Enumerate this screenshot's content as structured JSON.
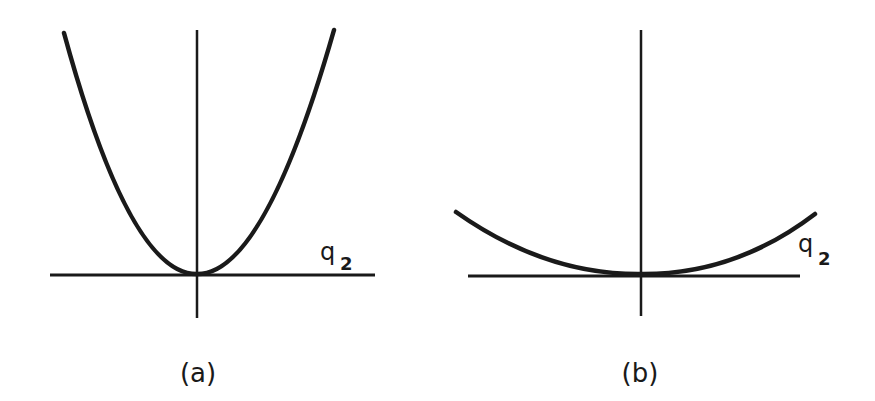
{
  "panels": [
    {
      "id": "a",
      "caption": "(a)",
      "axis_label": "q",
      "axis_subscript": "2",
      "description": "steep parabola (large curvature) with minimum at origin"
    },
    {
      "id": "b",
      "caption": "(b)",
      "axis_label": "q",
      "axis_subscript": "2",
      "description": "shallow parabola (small curvature) with minimum at origin"
    }
  ],
  "colors": {
    "stroke": "#1a1a1a",
    "background": "#ffffff"
  }
}
